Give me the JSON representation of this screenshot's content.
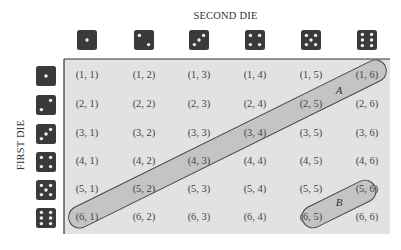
{
  "titles": {
    "columns": "SECOND DIE",
    "rows": "FIRST DIE"
  },
  "colors": {
    "grid_fill": "#e2e2e2",
    "event_fill": "#c4c4c4",
    "event_stroke": "#444444",
    "die_face": "#3a3a3a",
    "die_pip": "#f2f2f2"
  },
  "dice": [
    1,
    2,
    3,
    4,
    5,
    6
  ],
  "grid": [
    [
      "(1, 1)",
      "(1, 2)",
      "(1, 3)",
      "(1, 4)",
      "(1, 5)",
      "(1, 6)"
    ],
    [
      "(2, 1)",
      "(2, 2)",
      "(2, 3)",
      "(2, 4)",
      "(2, 5)",
      "(2, 6)"
    ],
    [
      "(3, 1)",
      "(3, 2)",
      "(3, 3)",
      "(3, 4)",
      "(3, 5)",
      "(3, 6)"
    ],
    [
      "(4, 1)",
      "(4, 2)",
      "(4, 3)",
      "(4, 4)",
      "(4, 5)",
      "(4, 6)"
    ],
    [
      "(5, 1)",
      "(5, 2)",
      "(5, 3)",
      "(5, 4)",
      "(5, 5)",
      "(5, 6)"
    ],
    [
      "(6, 1)",
      "(6, 2)",
      "(6, 3)",
      "(6, 4)",
      "(6, 5)",
      "(6, 6)"
    ]
  ],
  "events": [
    {
      "label": "A",
      "cells": [
        "(6, 1)",
        "(5, 2)",
        "(4, 3)",
        "(3, 4)",
        "(2, 5)",
        "(1, 6)"
      ]
    },
    {
      "label": "B",
      "cells": [
        "(6, 5)",
        "(5, 6)"
      ]
    }
  ]
}
